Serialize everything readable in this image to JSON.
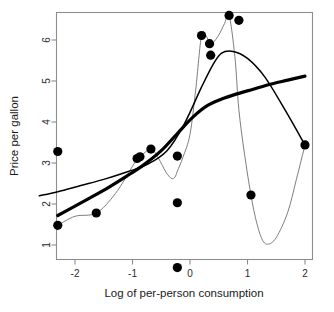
{
  "chart_data": {
    "type": "scatter",
    "title": "",
    "xlabel": "Log of per-person consumption",
    "ylabel": "Price per gallon",
    "xlim": [
      -2.62,
      -2.62
    ],
    "ylim": [
      0.1,
      6.95
    ],
    "xticks": [
      -2,
      -1,
      0,
      1,
      2
    ],
    "xtick_labels": [
      "-2",
      "-1",
      "0",
      "1",
      "2"
    ],
    "yticks": [
      1,
      2,
      3,
      4,
      5,
      6
    ],
    "ytick_labels": [
      "1",
      "2",
      "3",
      "4",
      "5",
      "6"
    ],
    "grid": false,
    "legend": "none",
    "x": [
      -2.3,
      -2.3,
      -1.63,
      -0.92,
      -0.87,
      -0.68,
      -0.22,
      -0.22,
      -0.22,
      0.2,
      0.34,
      0.36,
      0.68,
      0.85,
      1.06,
      2.0
    ],
    "y": [
      3.28,
      1.48,
      1.78,
      3.11,
      3.15,
      3.34,
      3.17,
      2.03,
      0.45,
      6.11,
      5.91,
      5.63,
      6.6,
      6.48,
      2.22,
      3.44
    ],
    "point_label": "data-point",
    "series": [
      {
        "name": "thick-smooth-fit",
        "style": "thick",
        "x": [
          -2.3,
          -2.0,
          -1.7,
          -1.4,
          -1.1,
          -0.8,
          -0.5,
          -0.22,
          0.05,
          0.3,
          0.55,
          0.8,
          1.1,
          1.4,
          1.7,
          2.0
        ],
        "y": [
          1.72,
          1.95,
          2.18,
          2.42,
          2.68,
          2.96,
          3.3,
          3.72,
          4.12,
          4.4,
          4.56,
          4.68,
          4.8,
          4.92,
          5.02,
          5.12
        ]
      },
      {
        "name": "medium-fit",
        "style": "medium",
        "x": [
          -2.62,
          -2.3,
          -1.9,
          -1.5,
          -1.1,
          -0.75,
          -0.4,
          -0.1,
          0.2,
          0.4,
          0.55,
          0.75,
          1.0,
          1.3,
          1.65,
          2.0
        ],
        "y": [
          2.2,
          2.3,
          2.45,
          2.6,
          2.78,
          2.96,
          3.3,
          3.95,
          4.85,
          5.4,
          5.68,
          5.72,
          5.55,
          5.1,
          4.3,
          3.44
        ]
      },
      {
        "name": "thin-interpolating-curve",
        "style": "thin",
        "x": [
          -2.3,
          -2.0,
          -1.63,
          -1.3,
          -1.0,
          -0.92,
          -0.87,
          -0.68,
          -0.55,
          -0.42,
          -0.32,
          -0.26,
          -0.22,
          -0.12,
          0.0,
          0.1,
          0.2,
          0.28,
          0.34,
          0.36,
          0.5,
          0.6,
          0.68,
          0.78,
          0.85,
          0.95,
          1.06,
          1.15,
          1.25,
          1.35,
          1.5,
          1.7,
          1.85,
          2.0
        ],
        "y": [
          1.48,
          1.7,
          1.78,
          2.25,
          2.92,
          3.11,
          3.15,
          3.34,
          3.12,
          2.78,
          2.62,
          2.66,
          2.8,
          3.15,
          3.7,
          4.8,
          6.11,
          6.1,
          5.91,
          5.86,
          6.12,
          6.4,
          6.6,
          5.6,
          4.3,
          3.2,
          2.22,
          1.6,
          1.15,
          1.02,
          1.18,
          1.8,
          2.6,
          3.44
        ]
      }
    ]
  }
}
